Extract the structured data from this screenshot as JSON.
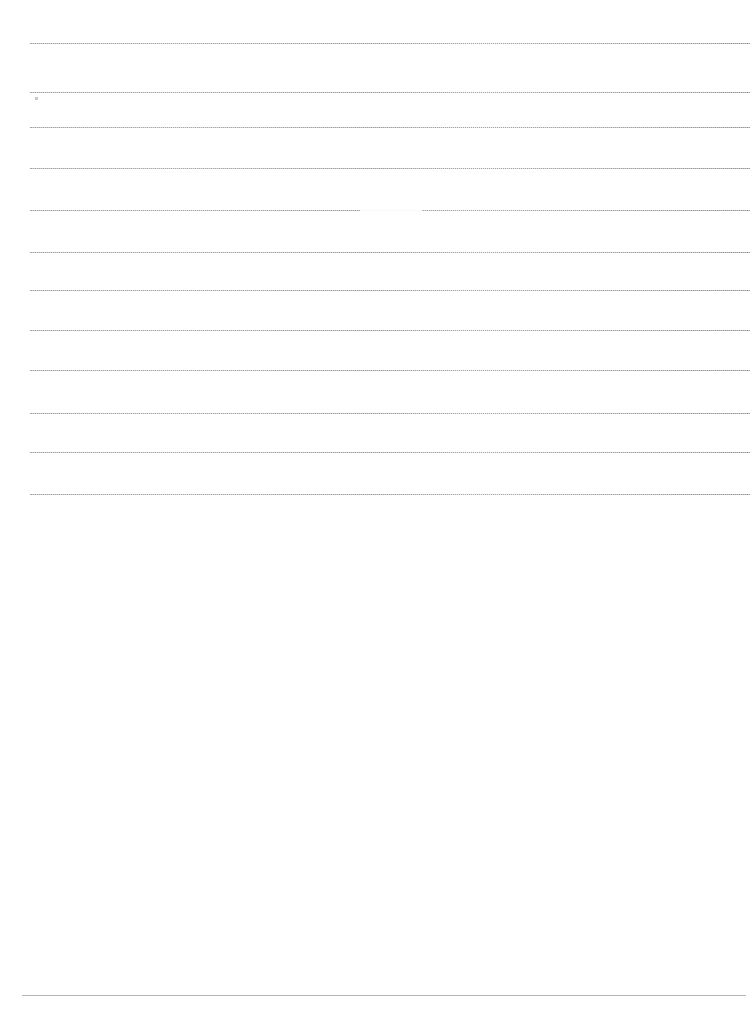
{
  "document": {
    "kind": "scanned-lined-page",
    "page_width": 755,
    "page_height": 1034,
    "background_color": "#ffffff",
    "visible_text": "",
    "note_label": ""
  },
  "ruled_lines": {
    "count": 12,
    "style": "dotted",
    "color": "#8e8e8e",
    "left_x": 30,
    "right_x": 750,
    "items": [
      {
        "index": 1,
        "y": 43,
        "faded": false
      },
      {
        "index": 2,
        "y": 92,
        "faded": false
      },
      {
        "index": 3,
        "y": 127,
        "faded": false
      },
      {
        "index": 4,
        "y": 168,
        "faded": false
      },
      {
        "index": 5,
        "y": 210,
        "faded": true
      },
      {
        "index": 6,
        "y": 252,
        "faded": false
      },
      {
        "index": 7,
        "y": 290,
        "faded": false
      },
      {
        "index": 8,
        "y": 330,
        "faded": false
      },
      {
        "index": 9,
        "y": 370,
        "faded": false
      },
      {
        "index": 10,
        "y": 413,
        "faded": false
      },
      {
        "index": 11,
        "y": 452,
        "faded": false
      },
      {
        "index": 12,
        "y": 494,
        "faded": false
      }
    ]
  },
  "footer_rule": {
    "y": 995,
    "left_x": 22,
    "right_x": 746,
    "color": "#b4b4b4",
    "style": "solid"
  },
  "artifacts": {
    "speck": {
      "x": 35,
      "y": 97
    }
  }
}
